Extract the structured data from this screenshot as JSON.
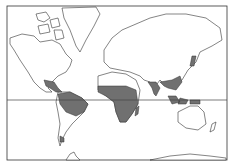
{
  "map": {
    "type": "world distribution map",
    "projection": "Mercator",
    "colors": {
      "background": "#ffffff",
      "land": "#ffffff",
      "outline": "#333333",
      "range": "#707070"
    },
    "features": {
      "frame": true,
      "equator_line": true
    },
    "shaded_regions": [
      "Central America / Mexico",
      "Caribbean",
      "Northern South America",
      "Sub-Saharan Africa",
      "Madagascar",
      "India",
      "Southeast Asia",
      "Southern China",
      "Japan",
      "Indonesia / Philippines / New Guinea",
      "Tierra del Fuego"
    ]
  }
}
